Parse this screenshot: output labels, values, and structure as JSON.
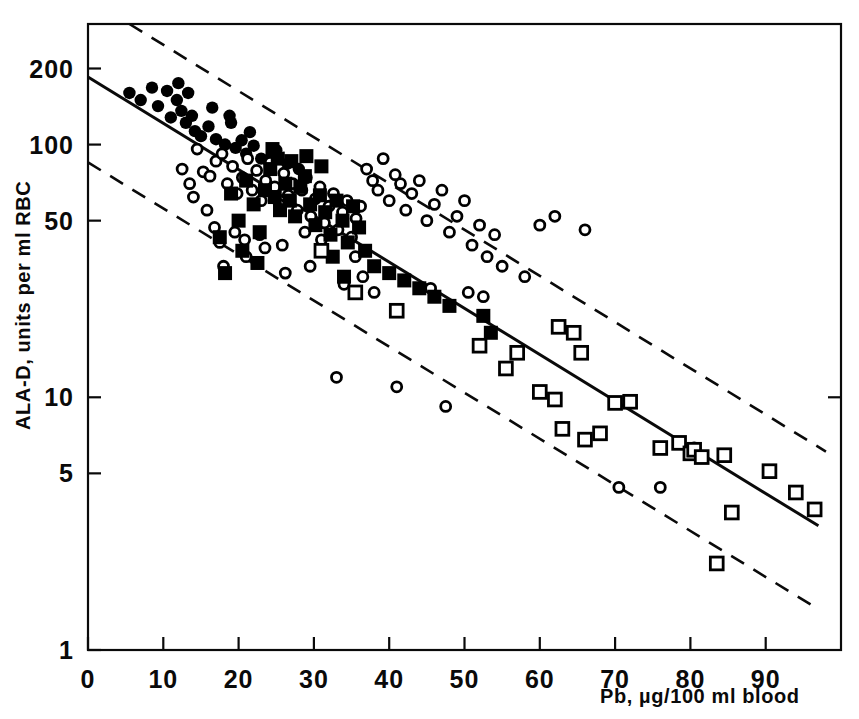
{
  "chart_data": {
    "type": "scatter",
    "title": "",
    "subtitle": "",
    "xlabel": "Pb, µg/100 ml blood",
    "ylabel": "ALA-D, units per ml RBC",
    "xlim": [
      0,
      100
    ],
    "ylim": [
      1,
      300
    ],
    "yscale": "log",
    "xscale": "linear",
    "grid": false,
    "legend": "none",
    "xticks": [
      0,
      10,
      20,
      30,
      40,
      50,
      60,
      70,
      80,
      90
    ],
    "xticklabels": [
      "0",
      "10",
      "20",
      "30",
      "40",
      "50",
      "60",
      "70",
      "80",
      "90"
    ],
    "yticks": [
      1,
      5,
      10,
      50,
      100,
      200
    ],
    "yticklabels": [
      "1",
      "5",
      "10",
      "50",
      "100",
      "200"
    ],
    "annotations": [],
    "series": [
      {
        "name": "filled-circle",
        "marker": "filled-circle",
        "color": "#000000",
        "points": [
          [
            5.5,
            160
          ],
          [
            7.0,
            150
          ],
          [
            8.5,
            168
          ],
          [
            9.3,
            142
          ],
          [
            10.5,
            163
          ],
          [
            11.0,
            128
          ],
          [
            11.8,
            150
          ],
          [
            12.4,
            136
          ],
          [
            13.0,
            122
          ],
          [
            13.3,
            160
          ],
          [
            13.8,
            130
          ],
          [
            14.2,
            113
          ],
          [
            15.0,
            108
          ],
          [
            16.0,
            118
          ],
          [
            17.0,
            105
          ],
          [
            18.2,
            100
          ],
          [
            19.0,
            122
          ],
          [
            19.6,
            97
          ],
          [
            20.4,
            104
          ],
          [
            21.0,
            92
          ],
          [
            22.0,
            99
          ],
          [
            23.0,
            88
          ],
          [
            24.0,
            86
          ],
          [
            25.0,
            95
          ],
          [
            12.0,
            175
          ],
          [
            16.5,
            140
          ],
          [
            18.8,
            130
          ],
          [
            21.5,
            112
          ],
          [
            26.5,
            84
          ],
          [
            28.0,
            80
          ]
        ]
      },
      {
        "name": "open-circle",
        "marker": "open-circle",
        "color": "#000000",
        "points": [
          [
            14.5,
            96
          ],
          [
            15.3,
            78
          ],
          [
            16.2,
            75
          ],
          [
            17.0,
            86
          ],
          [
            17.8,
            92
          ],
          [
            18.5,
            70
          ],
          [
            19.2,
            82
          ],
          [
            19.8,
            64
          ],
          [
            20.5,
            74
          ],
          [
            21.2,
            88
          ],
          [
            21.8,
            66
          ],
          [
            22.4,
            79
          ],
          [
            23.0,
            60
          ],
          [
            23.6,
            72
          ],
          [
            24.2,
            85
          ],
          [
            24.8,
            68
          ],
          [
            25.4,
            58
          ],
          [
            26.0,
            77
          ],
          [
            26.6,
            63
          ],
          [
            27.2,
            70
          ],
          [
            27.8,
            55
          ],
          [
            28.4,
            66
          ],
          [
            29.0,
            74
          ],
          [
            29.6,
            52
          ],
          [
            30.2,
            61
          ],
          [
            30.8,
            68
          ],
          [
            31.4,
            49
          ],
          [
            32.0,
            57
          ],
          [
            32.6,
            64
          ],
          [
            33.2,
            46
          ],
          [
            33.8,
            54
          ],
          [
            34.4,
            60
          ],
          [
            35.0,
            43
          ],
          [
            35.6,
            51
          ],
          [
            36.2,
            57
          ],
          [
            12.5,
            80
          ],
          [
            13.5,
            70
          ],
          [
            14.0,
            62
          ],
          [
            15.8,
            55
          ],
          [
            16.8,
            47
          ],
          [
            17.5,
            41
          ],
          [
            19.5,
            45
          ],
          [
            20.8,
            42
          ],
          [
            22.8,
            44
          ],
          [
            25.8,
            40
          ],
          [
            18.0,
            33
          ],
          [
            21.0,
            36
          ],
          [
            23.5,
            39
          ],
          [
            28.8,
            45
          ],
          [
            31.0,
            42
          ],
          [
            37.0,
            80
          ],
          [
            37.8,
            72
          ],
          [
            38.5,
            66
          ],
          [
            39.2,
            88
          ],
          [
            40.0,
            60
          ],
          [
            40.8,
            76
          ],
          [
            41.5,
            70
          ],
          [
            42.2,
            55
          ],
          [
            43.0,
            64
          ],
          [
            44.0,
            72
          ],
          [
            45.0,
            50
          ],
          [
            46.0,
            58
          ],
          [
            47.0,
            66
          ],
          [
            48.0,
            45
          ],
          [
            49.0,
            52
          ],
          [
            50.0,
            60
          ],
          [
            51.0,
            40
          ],
          [
            52.0,
            48
          ],
          [
            53.0,
            36
          ],
          [
            54.0,
            44
          ],
          [
            41.0,
            11
          ],
          [
            45.5,
            27
          ],
          [
            47.5,
            9.2
          ],
          [
            50.5,
            26
          ],
          [
            52.5,
            25
          ],
          [
            55.0,
            33
          ],
          [
            58.0,
            30
          ],
          [
            60.0,
            48
          ],
          [
            62.0,
            52
          ],
          [
            66.0,
            46
          ],
          [
            34.0,
            28
          ],
          [
            36.5,
            30
          ],
          [
            38.0,
            26
          ],
          [
            70.5,
            4.4
          ],
          [
            76.0,
            4.4
          ],
          [
            80.5,
            6.3
          ],
          [
            33.0,
            12
          ],
          [
            26.2,
            31
          ],
          [
            29.5,
            33
          ],
          [
            35.5,
            36
          ]
        ]
      },
      {
        "name": "filled-square",
        "marker": "filled-square",
        "color": "#000000",
        "points": [
          [
            17.5,
            43
          ],
          [
            18.2,
            31
          ],
          [
            19.0,
            64
          ],
          [
            20.0,
            50
          ],
          [
            21.0,
            72
          ],
          [
            22.0,
            58
          ],
          [
            22.8,
            45
          ],
          [
            23.5,
            66
          ],
          [
            24.2,
            80
          ],
          [
            24.8,
            62
          ],
          [
            25.5,
            55
          ],
          [
            26.2,
            70
          ],
          [
            26.8,
            60
          ],
          [
            27.5,
            52
          ],
          [
            28.2,
            68
          ],
          [
            28.8,
            75
          ],
          [
            29.5,
            58
          ],
          [
            30.2,
            48
          ],
          [
            30.8,
            63
          ],
          [
            31.5,
            54
          ],
          [
            32.2,
            44
          ],
          [
            33.0,
            60
          ],
          [
            33.8,
            50
          ],
          [
            34.5,
            41
          ],
          [
            35.2,
            57
          ],
          [
            36.0,
            47
          ],
          [
            24.5,
            96
          ],
          [
            25.2,
            88
          ],
          [
            27.0,
            86
          ],
          [
            29.0,
            90
          ],
          [
            31.0,
            82
          ],
          [
            20.5,
            38
          ],
          [
            22.5,
            34
          ],
          [
            32.5,
            36
          ],
          [
            34.0,
            30
          ],
          [
            36.8,
            38
          ],
          [
            38.0,
            33
          ],
          [
            40.0,
            31
          ],
          [
            42.0,
            29
          ],
          [
            44.0,
            27
          ],
          [
            46.0,
            25
          ],
          [
            48.0,
            23
          ],
          [
            52.5,
            21
          ],
          [
            53.5,
            18
          ]
        ]
      },
      {
        "name": "open-square",
        "marker": "open-square",
        "color": "#000000",
        "points": [
          [
            31.0,
            38
          ],
          [
            35.5,
            26
          ],
          [
            41.0,
            22
          ],
          [
            52.0,
            16
          ],
          [
            55.5,
            13
          ],
          [
            60.0,
            10.5
          ],
          [
            62.5,
            19
          ],
          [
            64.5,
            18
          ],
          [
            65.5,
            15
          ],
          [
            62.0,
            9.8
          ],
          [
            63.0,
            7.5
          ],
          [
            66.0,
            6.8
          ],
          [
            70.0,
            9.5
          ],
          [
            72.0,
            9.6
          ],
          [
            76.0,
            6.3
          ],
          [
            78.5,
            6.6
          ],
          [
            80.0,
            6.0
          ],
          [
            80.5,
            6.2
          ],
          [
            81.5,
            5.8
          ],
          [
            84.5,
            5.9
          ],
          [
            85.5,
            3.5
          ],
          [
            83.5,
            2.2
          ],
          [
            90.5,
            5.1
          ],
          [
            94.0,
            4.2
          ],
          [
            96.5,
            3.6
          ],
          [
            57.0,
            15
          ],
          [
            68.0,
            7.2
          ]
        ]
      }
    ],
    "lines": [
      {
        "name": "regression-line",
        "style": "solid",
        "points": [
          [
            0,
            185
          ],
          [
            97,
            3.1
          ]
        ]
      },
      {
        "name": "upper-confidence-band",
        "style": "dashed",
        "points": [
          [
            5.5,
            300
          ],
          [
            98,
            6.1
          ]
        ]
      },
      {
        "name": "lower-confidence-band",
        "style": "dashed",
        "points": [
          [
            0,
            85
          ],
          [
            97,
            1.45
          ]
        ]
      }
    ]
  },
  "axes": {
    "y_axis_title": "ALA-D, units per ml RBC",
    "x_axis_title": "Pb, µg/100 ml blood",
    "y_ticklabels": [
      "200",
      "100",
      "50",
      "10",
      "5",
      "1"
    ],
    "x_ticklabels": [
      "0",
      "10",
      "20",
      "30",
      "40",
      "50",
      "60",
      "70",
      "80",
      "90"
    ]
  },
  "colors": {
    "ink": "#0a0a0a",
    "background": "#ffffff",
    "marker": "#000000"
  }
}
